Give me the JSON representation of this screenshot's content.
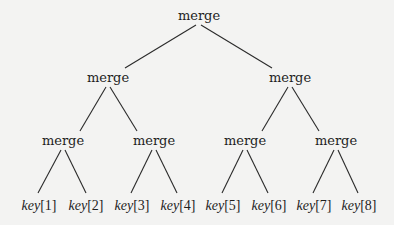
{
  "diagram": {
    "type": "binary-merge-tree",
    "background": "#f3f3f2",
    "line_color": "#2a2a2a",
    "nodes": {
      "root": {
        "label": "merge",
        "x": 199,
        "y": 9
      },
      "l1": [
        {
          "label": "merge",
          "x": 108,
          "y": 71
        },
        {
          "label": "merge",
          "x": 290,
          "y": 71
        }
      ],
      "l2": [
        {
          "label": "merge",
          "x": 63,
          "y": 134
        },
        {
          "label": "merge",
          "x": 154,
          "y": 134
        },
        {
          "label": "merge",
          "x": 245,
          "y": 134
        },
        {
          "label": "merge",
          "x": 336,
          "y": 134
        }
      ],
      "leaves": [
        {
          "name": "key",
          "index": "[1]",
          "x": 39,
          "y": 199
        },
        {
          "name": "key",
          "index": "[2]",
          "x": 86,
          "y": 199
        },
        {
          "name": "key",
          "index": "[3]",
          "x": 132,
          "y": 199
        },
        {
          "name": "key",
          "index": "[4]",
          "x": 178,
          "y": 199
        },
        {
          "name": "key",
          "index": "[5]",
          "x": 223,
          "y": 199
        },
        {
          "name": "key",
          "index": "[6]",
          "x": 269,
          "y": 199
        },
        {
          "name": "key",
          "index": "[7]",
          "x": 314,
          "y": 199
        },
        {
          "name": "key",
          "index": "[8]",
          "x": 359,
          "y": 199
        }
      ]
    }
  }
}
